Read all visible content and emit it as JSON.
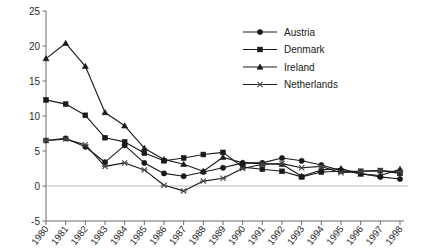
{
  "chart_data": {
    "type": "line",
    "title": "",
    "xlabel": "",
    "ylabel": "",
    "x": [
      1980,
      1981,
      1982,
      1983,
      1984,
      1985,
      1986,
      1987,
      1988,
      1989,
      1990,
      1991,
      1992,
      1993,
      1994,
      1995,
      1996,
      1997,
      1998
    ],
    "xtick_labels": [
      "1980",
      "1981",
      "1982",
      "1983",
      "1984",
      "1985",
      "1986",
      "1987",
      "1988",
      "1989",
      "1990",
      "1991",
      "1992",
      "1993",
      "1994",
      "1995",
      "1996",
      "1997",
      "1998"
    ],
    "ytick_labels": [
      "-5",
      "0",
      "5",
      "10",
      "15",
      "20",
      "25"
    ],
    "yticks": [
      -5,
      0,
      5,
      10,
      15,
      20,
      25
    ],
    "ylim": [
      -5,
      25
    ],
    "grid": false,
    "zero_line": true,
    "legend_position": "top-right",
    "series": [
      {
        "name": "Austria",
        "marker": "circle",
        "values": [
          6.5,
          6.8,
          5.6,
          3.4,
          5.8,
          3.3,
          1.8,
          1.4,
          2.0,
          2.6,
          3.3,
          3.3,
          4.0,
          3.6,
          3.0,
          2.2,
          1.8,
          1.3,
          1.0
        ]
      },
      {
        "name": "Denmark",
        "marker": "square",
        "values": [
          12.3,
          11.7,
          10.1,
          6.9,
          6.3,
          4.7,
          3.6,
          4.0,
          4.5,
          4.8,
          2.7,
          2.4,
          2.1,
          1.3,
          2.0,
          2.1,
          2.1,
          2.2,
          1.8
        ]
      },
      {
        "name": "Ireland",
        "marker": "triangle",
        "values": [
          18.2,
          20.4,
          17.1,
          10.5,
          8.6,
          5.4,
          3.8,
          3.1,
          2.1,
          4.1,
          3.3,
          3.2,
          3.1,
          1.4,
          2.3,
          2.5,
          1.7,
          1.5,
          2.4
        ]
      },
      {
        "name": "Netherlands",
        "marker": "x",
        "values": [
          6.5,
          6.7,
          5.9,
          2.8,
          3.3,
          2.3,
          0.1,
          -0.7,
          0.7,
          1.1,
          2.5,
          3.1,
          3.2,
          2.6,
          2.8,
          1.9,
          2.1,
          2.2,
          2.0
        ]
      }
    ]
  },
  "legend": {
    "entries": [
      {
        "label": "Austria"
      },
      {
        "label": "Denmark"
      },
      {
        "label": "Ireland"
      },
      {
        "label": "Netherlands"
      }
    ]
  },
  "colors": {
    "ink": "#1a1a1a",
    "axis": "#6b6b6b",
    "zero": "#b9b9b9",
    "background": "#ffffff"
  }
}
